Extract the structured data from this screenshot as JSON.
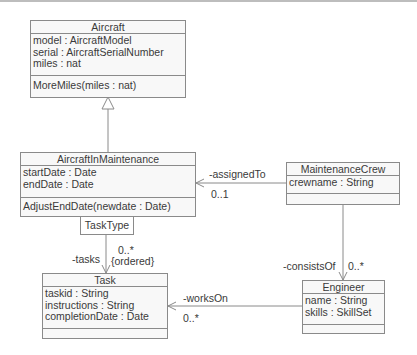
{
  "diagram": {
    "type": "UML class diagram",
    "classes": [
      {
        "name": "Aircraft",
        "attributes": [
          "model : AircraftModel",
          "serial : AircraftSerialNumber",
          "miles : nat"
        ],
        "operations": [
          "MoreMiles(miles : nat)"
        ]
      },
      {
        "name": "AircraftInMaintenance",
        "attributes": [
          "startDate : Date",
          "endDate : Date"
        ],
        "operations": [
          "AdjustEndDate(newdate : Date)"
        ]
      },
      {
        "name": "MaintenanceCrew",
        "attributes": [
          "crewname : String"
        ],
        "operations": []
      },
      {
        "name": "Task",
        "attributes": [
          "taskid : String",
          "instructions : String",
          "completionDate : Date"
        ],
        "operations": []
      },
      {
        "name": "Engineer",
        "attributes": [
          "name : String",
          "skills : SkillSet"
        ],
        "operations": []
      }
    ],
    "qualifier": {
      "label": "TaskType",
      "owner": "AircraftInMaintenance"
    },
    "relationships": [
      {
        "type": "generalization",
        "from": "AircraftInMaintenance",
        "to": "Aircraft"
      },
      {
        "type": "association",
        "from": "MaintenanceCrew",
        "to": "AircraftInMaintenance",
        "role": "-assignedTo",
        "multiplicity": "0..1"
      },
      {
        "type": "qualified-association",
        "from": "AircraftInMaintenance",
        "to": "Task",
        "role": "-tasks",
        "multiplicity": "0..*",
        "constraint": "{ordered}"
      },
      {
        "type": "association",
        "from": "MaintenanceCrew",
        "to": "Engineer",
        "role": "-consistsOf",
        "multiplicity": "0..*"
      },
      {
        "type": "association",
        "from": "Engineer",
        "to": "Task",
        "role": "-worksOn",
        "multiplicity": "0..*"
      }
    ]
  },
  "colors": {
    "background": "#ffffff",
    "box_fill": "#f8f8f8",
    "border": "#8a8a8a",
    "text": "#3a3a3a"
  }
}
